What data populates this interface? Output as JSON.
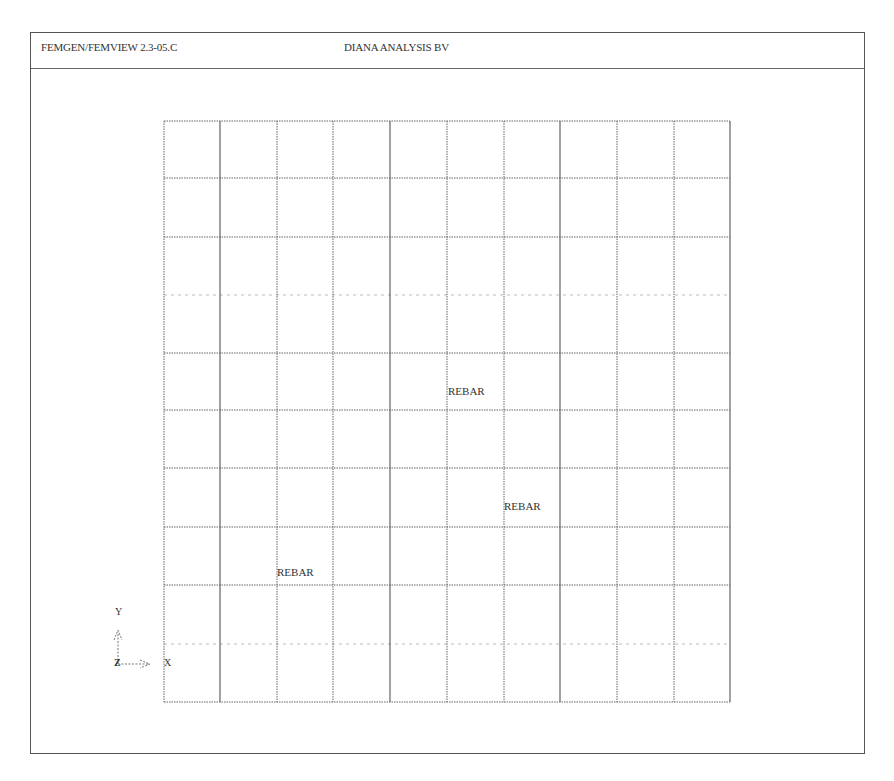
{
  "header": {
    "left_title": "FEMGEN/FEMVIEW 2.3-05.C",
    "center_title": "DIANA ANALYSIS BV"
  },
  "mesh": {
    "columns": 10,
    "rows": 10,
    "x_lines": [
      164,
      220,
      277,
      333,
      390,
      447,
      504,
      560,
      617,
      674,
      730
    ],
    "y_lines": [
      121,
      178,
      237,
      295,
      353,
      410,
      468,
      527,
      585,
      644,
      702
    ],
    "solid_x_lines": [
      220,
      390,
      560,
      730
    ],
    "line_color": "#555555"
  },
  "labels": [
    {
      "text": "REBAR",
      "x": 448,
      "y": 385
    },
    {
      "text": "REBAR",
      "x": 504,
      "y": 500
    },
    {
      "text": "REBAR",
      "x": 277,
      "y": 566
    }
  ],
  "axes": {
    "y_label": "Y",
    "x_label": "X",
    "z_label": "Z"
  }
}
